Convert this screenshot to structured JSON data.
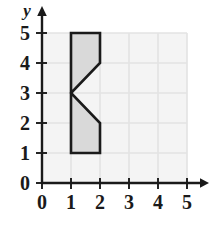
{
  "figure": {
    "kind": "coordinate-grid-polygon",
    "background_color": "#ffffff"
  },
  "axes": {
    "x_axis_label": "",
    "y_axis_label": "y",
    "x_ticks": [
      "0",
      "1",
      "2",
      "3",
      "4",
      "5"
    ],
    "y_ticks": [
      "0",
      "1",
      "2",
      "3",
      "4",
      "5"
    ],
    "x_range": [
      0,
      5
    ],
    "y_range": [
      0,
      5
    ],
    "axis_color": "#1a1a1a",
    "grid_color": "#e3e3e3",
    "grid_on": true,
    "grid_fill": "#f4f4f4",
    "x_arrow": true,
    "y_arrow": true
  },
  "chart_data": {
    "type": "scatter",
    "title": "",
    "xlabel": "",
    "ylabel": "y",
    "xlim": [
      0,
      5
    ],
    "ylim": [
      0,
      5
    ],
    "grid": true,
    "x_ticks": [
      0,
      1,
      2,
      3,
      4,
      5
    ],
    "y_ticks": [
      0,
      1,
      2,
      3,
      4,
      5
    ],
    "shapes": [
      {
        "name": "notched-rectangle",
        "kind": "polygon",
        "closed": true,
        "fill_color": "#d9d9d9",
        "stroke_color": "#1a1a1a",
        "stroke_width": 2.6,
        "vertices": [
          [
            1,
            5
          ],
          [
            2,
            5
          ],
          [
            2,
            4
          ],
          [
            1,
            3
          ],
          [
            2,
            2
          ],
          [
            2,
            1
          ],
          [
            1,
            1
          ]
        ]
      }
    ]
  }
}
